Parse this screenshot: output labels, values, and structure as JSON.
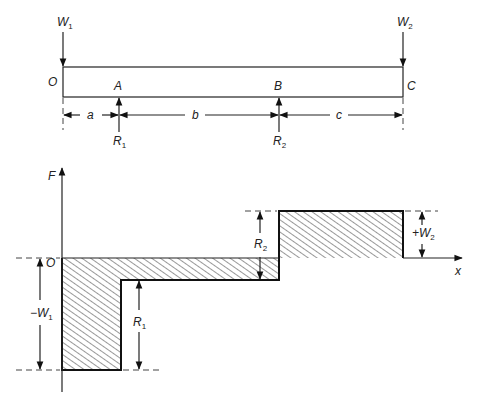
{
  "beam": {
    "loads": [
      {
        "label": "W",
        "sub": "1"
      },
      {
        "label": "W",
        "sub": "2"
      }
    ],
    "points": {
      "O": "O",
      "A": "A",
      "B": "B",
      "C": "C"
    },
    "dimensions": {
      "a": "a",
      "b": "b",
      "c": "c"
    },
    "reactions": [
      {
        "label": "R",
        "sub": "1"
      },
      {
        "label": "R",
        "sub": "2"
      }
    ]
  },
  "force_diagram": {
    "y_axis": "F",
    "x_axis": "x",
    "origin": "O",
    "annotations": {
      "minus_w1": {
        "prefix": "−W",
        "sub": "1"
      },
      "r1": {
        "label": "R",
        "sub": "1"
      },
      "r2": {
        "label": "R",
        "sub": "2"
      },
      "plus_w2": {
        "prefix": "+W",
        "sub": "2"
      }
    }
  }
}
